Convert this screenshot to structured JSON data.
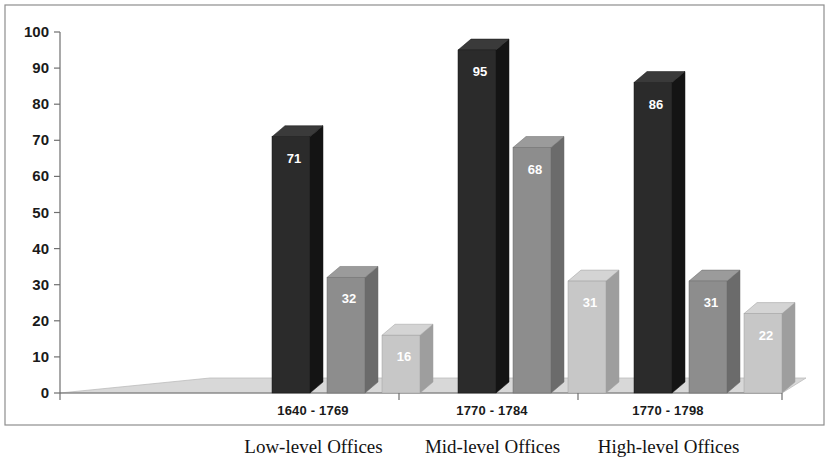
{
  "chart_data": {
    "type": "bar",
    "title": "",
    "subtitle": "",
    "xlabel": "",
    "ylabel": "",
    "ylim": [
      0,
      100
    ],
    "ytick_step": 10,
    "yticks": [
      0,
      10,
      20,
      30,
      40,
      50,
      60,
      70,
      80,
      90,
      100
    ],
    "grid": false,
    "legend_position": "none",
    "style_3d": true,
    "categories": [
      "1640 - 1769",
      "1770 - 1784",
      "1770 - 1798"
    ],
    "group_captions": [
      "Low-level Offices",
      "Mid-level Offices",
      "High-level Offices"
    ],
    "series": [
      {
        "name": "series-1",
        "color": "#2b2b2b",
        "side_color": "#141414",
        "top_color": "#3a3a3a",
        "values": [
          71,
          95,
          86
        ]
      },
      {
        "name": "series-2",
        "color": "#8d8d8d",
        "side_color": "#6b6b6b",
        "top_color": "#9b9b9b",
        "values": [
          32,
          68,
          31
        ]
      },
      {
        "name": "series-3",
        "color": "#c7c7c7",
        "side_color": "#9e9e9e",
        "top_color": "#d4d4d4",
        "values": [
          16,
          31,
          22
        ]
      }
    ],
    "bar_labels": [
      [
        "71",
        "32",
        "16"
      ],
      [
        "95",
        "68",
        "31"
      ],
      [
        "86",
        "31",
        "22"
      ]
    ],
    "colors": {
      "border": "#8e8e8e",
      "axis": "#6f6f6f",
      "floor": "#d8d8d8",
      "floor_edge": "#bdbdbd",
      "background": "#ffffff",
      "text": "#1a1a1a"
    }
  }
}
